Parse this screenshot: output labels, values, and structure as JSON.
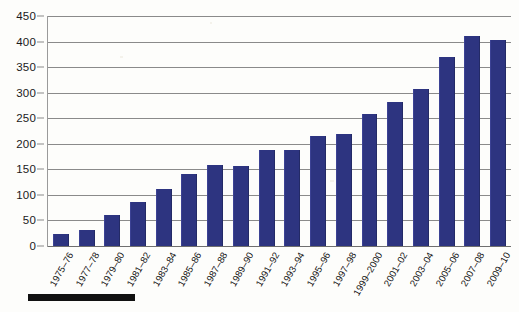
{
  "chart_data": {
    "type": "bar",
    "title": "",
    "subtitle": "",
    "xlabel": "",
    "ylabel": "",
    "ylim": [
      0,
      450
    ],
    "y_ticks": [
      0,
      50,
      100,
      150,
      200,
      250,
      300,
      350,
      400,
      450
    ],
    "grid": true,
    "legend_position": "none",
    "bar_color": "#2d3480",
    "gridline_color": "#8a8a8a",
    "categories": [
      "1975–76",
      "1977–78",
      "1979–80",
      "1981–82",
      "1983–84",
      "1985–86",
      "1987–88",
      "1989–90",
      "1991–92",
      "1993–94",
      "1995–96",
      "1997–98",
      "1999–2000",
      "2001–02",
      "2003–04",
      "2005–06",
      "2007–08",
      "2009–10"
    ],
    "values": [
      23,
      32,
      60,
      87,
      112,
      140,
      158,
      157,
      187,
      187,
      215,
      220,
      258,
      282,
      308,
      370,
      410,
      403
    ],
    "annotations": []
  },
  "figure": {
    "footer_rule_label": "scale-bar"
  }
}
